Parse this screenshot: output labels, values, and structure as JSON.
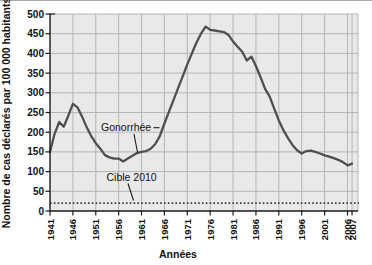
{
  "figure": {
    "y_axis_title": "Nombre de cas déclarés par 100 000 habitants",
    "x_axis_title": "Années"
  },
  "colors": {
    "plot_background": "#e9e9e9",
    "gridline": "#b5b5b5",
    "axis": "#1a1a1a",
    "series_line": "#4f4f4f",
    "target_line": "#3a3a3a",
    "text": "#111111"
  },
  "chart_data": {
    "type": "line",
    "title": "",
    "xlabel": "Années",
    "ylabel": "Nombre de cas déclarés par 100 000 habitants",
    "xlim": [
      1941,
      2008.3
    ],
    "ylim": [
      0,
      500
    ],
    "grid": true,
    "yticks": [
      0,
      50,
      100,
      150,
      200,
      250,
      300,
      350,
      400,
      450,
      500
    ],
    "xticks": [
      1941,
      1946,
      1951,
      1956,
      1961,
      1966,
      1971,
      1976,
      1981,
      1986,
      1991,
      1996,
      2001,
      2006,
      2007
    ],
    "series": [
      {
        "name": "Gonorrhée",
        "x": [
          1941,
          1942,
          1943,
          1944,
          1945,
          1946,
          1947,
          1948,
          1949,
          1950,
          1951,
          1952,
          1953,
          1954,
          1955,
          1956,
          1957,
          1958,
          1959,
          1960,
          1961,
          1962,
          1963,
          1964,
          1965,
          1966,
          1967,
          1968,
          1969,
          1970,
          1971,
          1972,
          1973,
          1974,
          1975,
          1976,
          1977,
          1978,
          1979,
          1980,
          1981,
          1982,
          1983,
          1984,
          1985,
          1986,
          1987,
          1988,
          1989,
          1990,
          1991,
          1992,
          1993,
          1994,
          1995,
          1996,
          1997,
          1998,
          1999,
          2000,
          2001,
          2002,
          2003,
          2004,
          2005,
          2006,
          2007
        ],
        "values": [
          150,
          196,
          226,
          214,
          242,
          272,
          263,
          240,
          213,
          190,
          172,
          158,
          142,
          136,
          133,
          133,
          126,
          133,
          140,
          147,
          150,
          152,
          158,
          170,
          190,
          222,
          252,
          282,
          312,
          342,
          372,
          400,
          427,
          450,
          468,
          460,
          458,
          456,
          454,
          447,
          430,
          417,
          404,
          382,
          392,
          368,
          340,
          310,
          290,
          260,
          230,
          205,
          185,
          167,
          154,
          146,
          152,
          153,
          150,
          146,
          141,
          138,
          134,
          130,
          124,
          116,
          120
        ]
      }
    ],
    "target_line": {
      "label": "Cible 2010",
      "value": 20,
      "style": "dotted"
    },
    "annotations": [
      {
        "text": "Gonorrhée"
      },
      {
        "text": "Cible 2010"
      }
    ],
    "legend": "none"
  }
}
